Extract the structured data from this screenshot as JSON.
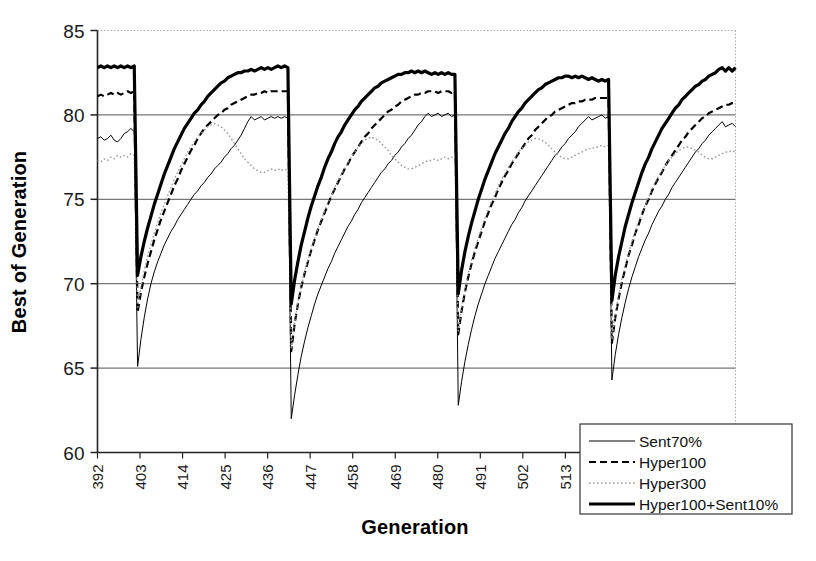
{
  "chart_data": {
    "type": "line",
    "title": "",
    "xlabel": "Generation",
    "ylabel": "Best of Generation",
    "xlim": [
      392,
      557
    ],
    "ylim": [
      60,
      85
    ],
    "xticks": [
      392,
      403,
      414,
      425,
      436,
      447,
      458,
      469,
      480,
      491,
      502,
      513,
      524,
      535,
      546
    ],
    "yticks": [
      60,
      65,
      70,
      75,
      80,
      85
    ],
    "grid": "horizontal-major",
    "legend_position": "bottom-right",
    "restart_generations": [
      402,
      448,
      493,
      538
    ],
    "series": [
      {
        "name": "Sent70%",
        "style": "thin-solid",
        "color": "#000000",
        "width": 1,
        "values": [
          78.6,
          78.7,
          78.5,
          78.6,
          78.8,
          78.5,
          78.4,
          78.6,
          78.9,
          79.0,
          79.2,
          79.0,
          65.1,
          66.7,
          68.0,
          69.1,
          70.0,
          70.7,
          71.3,
          71.8,
          72.3,
          72.7,
          73.1,
          73.4,
          73.8,
          74.1,
          74.4,
          74.7,
          75.0,
          75.3,
          75.5,
          75.8,
          76.0,
          76.3,
          76.5,
          76.8,
          77.0,
          77.2,
          77.5,
          77.7,
          78.0,
          78.2,
          78.5,
          78.8,
          79.2,
          79.6,
          79.9,
          79.7,
          79.8,
          79.9,
          79.7,
          79.8,
          79.9,
          79.8,
          79.9,
          79.8,
          79.9,
          79.8,
          62.0,
          63.4,
          64.6,
          65.7,
          66.6,
          67.4,
          68.1,
          68.8,
          69.4,
          69.9,
          70.4,
          70.9,
          71.3,
          71.8,
          72.2,
          72.6,
          73.0,
          73.4,
          73.7,
          74.1,
          74.4,
          74.8,
          75.1,
          75.4,
          75.7,
          76.0,
          76.3,
          76.6,
          76.8,
          77.1,
          77.3,
          77.6,
          77.8,
          78.1,
          78.3,
          78.6,
          78.8,
          79.1,
          79.4,
          79.6,
          79.9,
          80.1,
          79.9,
          80.0,
          80.1,
          79.9,
          80.0,
          80.1,
          79.9,
          80.0,
          62.8,
          64.2,
          65.4,
          66.4,
          67.3,
          68.1,
          68.8,
          69.4,
          70.0,
          70.5,
          71.0,
          71.5,
          71.9,
          72.3,
          72.7,
          73.1,
          73.5,
          73.8,
          74.2,
          74.5,
          74.9,
          75.2,
          75.5,
          75.8,
          76.1,
          76.4,
          76.7,
          77.0,
          77.3,
          77.6,
          77.8,
          78.1,
          78.3,
          78.6,
          78.8,
          79.0,
          79.3,
          79.5,
          79.7,
          79.9,
          79.7,
          79.8,
          79.9,
          80.0,
          79.8,
          79.9,
          64.3,
          65.8,
          67.0,
          68.0,
          68.9,
          69.7,
          70.4,
          71.0,
          71.6,
          72.1,
          72.6,
          73.0,
          73.5,
          73.9,
          74.3,
          74.6,
          75.0,
          75.3,
          75.7,
          76.0,
          76.3,
          76.6,
          76.9,
          77.2,
          77.5,
          77.8,
          78.0,
          78.3,
          78.5,
          78.8,
          79.0,
          79.2,
          79.4,
          79.6,
          79.3,
          79.4,
          79.5,
          79.3
        ]
      },
      {
        "name": "Hyper100",
        "style": "dashed",
        "color": "#000000",
        "width": 2.2,
        "values": [
          81.1,
          81.2,
          81.1,
          81.2,
          81.3,
          81.2,
          81.3,
          81.2,
          81.3,
          81.4,
          81.3,
          81.4,
          68.3,
          69.5,
          70.4,
          71.2,
          71.9,
          72.6,
          73.2,
          73.8,
          74.3,
          74.8,
          75.3,
          75.8,
          76.2,
          76.7,
          77.1,
          77.5,
          77.9,
          78.2,
          78.6,
          78.9,
          79.2,
          79.4,
          79.6,
          79.8,
          80.0,
          80.1,
          80.3,
          80.4,
          80.6,
          80.7,
          80.8,
          80.9,
          81.0,
          81.1,
          81.2,
          81.2,
          81.3,
          81.3,
          81.4,
          81.3,
          81.4,
          81.4,
          81.4,
          81.4,
          81.4,
          81.4,
          66.0,
          67.6,
          68.8,
          69.8,
          70.6,
          71.3,
          72.0,
          72.6,
          73.2,
          73.7,
          74.2,
          74.7,
          75.2,
          75.6,
          76.0,
          76.4,
          76.8,
          77.1,
          77.5,
          77.8,
          78.1,
          78.4,
          78.7,
          78.9,
          79.2,
          79.4,
          79.6,
          79.8,
          80.0,
          80.2,
          80.3,
          80.5,
          80.6,
          80.8,
          80.9,
          81.0,
          81.1,
          81.2,
          81.2,
          81.3,
          81.3,
          81.4,
          81.4,
          81.4,
          81.3,
          81.4,
          81.4,
          81.4,
          81.3,
          81.4,
          67.0,
          68.4,
          69.5,
          70.4,
          71.2,
          71.9,
          72.5,
          73.1,
          73.7,
          74.2,
          74.7,
          75.1,
          75.6,
          76.0,
          76.4,
          76.7,
          77.1,
          77.4,
          77.7,
          78.0,
          78.3,
          78.6,
          78.8,
          79.1,
          79.3,
          79.5,
          79.7,
          79.9,
          80.0,
          80.2,
          80.3,
          80.4,
          80.5,
          80.6,
          80.7,
          80.7,
          80.8,
          80.8,
          80.9,
          80.9,
          80.9,
          81.0,
          81.0,
          81.0,
          81.0,
          81.0,
          66.5,
          68.0,
          69.1,
          70.1,
          70.9,
          71.7,
          72.3,
          73.0,
          73.5,
          74.1,
          74.6,
          75.0,
          75.5,
          75.9,
          76.3,
          76.6,
          77.0,
          77.3,
          77.6,
          77.9,
          78.2,
          78.5,
          78.7,
          79.0,
          79.2,
          79.4,
          79.6,
          79.8,
          79.9,
          80.1,
          80.2,
          80.3,
          80.4,
          80.5,
          80.6,
          80.6,
          80.7,
          80.7
        ]
      },
      {
        "name": "Hyper300",
        "style": "dotted",
        "color": "#9a9a9a",
        "width": 1.4,
        "values": [
          77.3,
          77.2,
          77.4,
          77.3,
          77.5,
          77.4,
          77.6,
          77.5,
          77.6,
          77.5,
          77.7,
          77.6,
          68.5,
          69.8,
          70.8,
          71.6,
          72.3,
          73.0,
          73.6,
          74.2,
          74.7,
          75.2,
          75.7,
          76.2,
          76.6,
          77.0,
          77.4,
          77.8,
          78.1,
          78.4,
          78.7,
          78.9,
          79.1,
          79.3,
          79.4,
          79.5,
          79.4,
          79.3,
          79.1,
          78.9,
          78.6,
          78.3,
          78.0,
          77.7,
          77.4,
          77.2,
          77.0,
          76.8,
          76.7,
          76.6,
          76.6,
          76.7,
          76.8,
          76.7,
          76.8,
          76.7,
          76.8,
          76.7,
          66.2,
          67.7,
          68.9,
          69.9,
          70.7,
          71.4,
          72.1,
          72.7,
          73.3,
          73.8,
          74.3,
          74.8,
          75.2,
          75.7,
          76.1,
          76.5,
          76.8,
          77.2,
          77.5,
          77.8,
          78.1,
          78.3,
          78.5,
          78.6,
          78.7,
          78.6,
          78.5,
          78.3,
          78.1,
          77.9,
          77.6,
          77.4,
          77.2,
          77.0,
          76.9,
          76.8,
          76.8,
          76.9,
          77.0,
          77.1,
          77.2,
          77.3,
          77.3,
          77.4,
          77.3,
          77.4,
          77.5,
          77.4,
          77.5,
          77.4,
          67.2,
          68.6,
          69.7,
          70.6,
          71.4,
          72.1,
          72.7,
          73.3,
          73.9,
          74.4,
          74.9,
          75.3,
          75.8,
          76.2,
          76.5,
          76.9,
          77.2,
          77.5,
          77.8,
          78.0,
          78.2,
          78.4,
          78.5,
          78.6,
          78.6,
          78.5,
          78.4,
          78.2,
          78.0,
          77.8,
          77.6,
          77.5,
          77.4,
          77.4,
          77.5,
          77.6,
          77.7,
          77.8,
          77.9,
          78.0,
          78.0,
          78.1,
          78.1,
          78.2,
          78.1,
          78.2,
          66.7,
          68.2,
          69.3,
          70.3,
          71.1,
          71.8,
          72.5,
          73.1,
          73.7,
          74.2,
          74.7,
          75.1,
          75.6,
          76.0,
          76.4,
          76.7,
          77.0,
          77.3,
          77.5,
          77.7,
          77.9,
          78.0,
          78.1,
          78.1,
          78.0,
          77.9,
          77.8,
          77.6,
          77.5,
          77.4,
          77.4,
          77.5,
          77.6,
          77.7,
          77.8,
          77.8,
          77.9,
          77.8
        ]
      },
      {
        "name": "Hyper100+Sent10%",
        "style": "thick-solid",
        "color": "#000000",
        "width": 3.2,
        "values": [
          82.8,
          82.9,
          82.8,
          82.9,
          82.8,
          82.9,
          82.8,
          82.9,
          82.8,
          82.9,
          82.8,
          82.9,
          70.5,
          71.6,
          72.5,
          73.3,
          74.0,
          74.7,
          75.3,
          75.9,
          76.5,
          77.0,
          77.5,
          78.0,
          78.4,
          78.8,
          79.2,
          79.5,
          79.8,
          80.1,
          80.3,
          80.6,
          80.8,
          81.1,
          81.3,
          81.5,
          81.7,
          81.9,
          82.0,
          82.2,
          82.3,
          82.4,
          82.5,
          82.5,
          82.6,
          82.6,
          82.7,
          82.6,
          82.7,
          82.8,
          82.7,
          82.8,
          82.7,
          82.8,
          82.9,
          82.8,
          82.9,
          82.8,
          68.8,
          70.2,
          71.3,
          72.3,
          73.1,
          73.9,
          74.6,
          75.2,
          75.8,
          76.3,
          76.9,
          77.4,
          77.8,
          78.3,
          78.7,
          79.0,
          79.4,
          79.7,
          80.0,
          80.3,
          80.5,
          80.8,
          81.0,
          81.2,
          81.4,
          81.6,
          81.7,
          81.9,
          82.0,
          82.1,
          82.2,
          82.3,
          82.4,
          82.4,
          82.5,
          82.5,
          82.6,
          82.5,
          82.6,
          82.5,
          82.6,
          82.5,
          82.4,
          82.5,
          82.4,
          82.5,
          82.4,
          82.5,
          82.4,
          82.4,
          69.4,
          70.8,
          71.9,
          72.8,
          73.6,
          74.3,
          75.0,
          75.6,
          76.2,
          76.7,
          77.2,
          77.7,
          78.1,
          78.5,
          78.9,
          79.2,
          79.6,
          79.9,
          80.2,
          80.4,
          80.7,
          80.9,
          81.1,
          81.3,
          81.5,
          81.6,
          81.8,
          81.9,
          82.0,
          82.1,
          82.2,
          82.2,
          82.3,
          82.3,
          82.2,
          82.3,
          82.2,
          82.3,
          82.2,
          82.1,
          82.2,
          82.1,
          82.0,
          82.1,
          82.0,
          82.1,
          69.0,
          70.5,
          71.6,
          72.5,
          73.4,
          74.1,
          74.8,
          75.4,
          76.0,
          76.6,
          77.1,
          77.5,
          78.0,
          78.4,
          78.8,
          79.2,
          79.5,
          79.8,
          80.1,
          80.4,
          80.6,
          80.9,
          81.1,
          81.3,
          81.5,
          81.7,
          81.8,
          82.0,
          82.1,
          82.3,
          82.4,
          82.5,
          82.7,
          82.8,
          82.6,
          82.8,
          82.6,
          82.8
        ]
      }
    ]
  },
  "legend": {
    "items": [
      {
        "label": "Sent70%"
      },
      {
        "label": "Hyper100"
      },
      {
        "label": "Hyper300"
      },
      {
        "label": "Hyper100+Sent10%"
      }
    ]
  }
}
